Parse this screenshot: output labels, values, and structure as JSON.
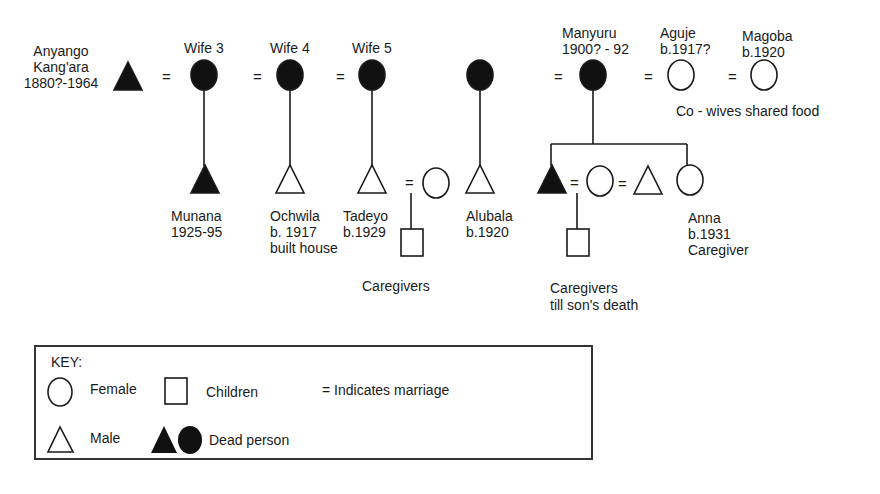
{
  "people": [
    {
      "id": "anyango",
      "shape": "triangle",
      "dead": true,
      "x": 128,
      "y": 77,
      "label": [
        "Anyango",
        "Kang'ara",
        "1880?-1964"
      ],
      "label_x": 8,
      "label_y": 43,
      "label_align": "center",
      "label_w": 106
    },
    {
      "id": "wife3",
      "shape": "circle",
      "dead": true,
      "x": 204,
      "y": 75,
      "label": [
        "Wife 3"
      ],
      "label_x": 184,
      "label_y": 40
    },
    {
      "id": "wife4",
      "shape": "circle",
      "dead": true,
      "x": 290,
      "y": 75,
      "label": [
        "Wife 4"
      ],
      "label_x": 270,
      "label_y": 40
    },
    {
      "id": "wife5",
      "shape": "circle",
      "dead": true,
      "x": 372,
      "y": 75,
      "label": [
        "Wife 5"
      ],
      "label_x": 352,
      "label_y": 40
    },
    {
      "id": "wife6",
      "shape": "circle",
      "dead": true,
      "x": 480,
      "y": 75,
      "label": []
    },
    {
      "id": "manyuru",
      "shape": "circle",
      "dead": true,
      "x": 593,
      "y": 75,
      "label": [
        "Manyuru",
        "1900? - 92"
      ],
      "label_x": 562,
      "label_y": 25
    },
    {
      "id": "aguje",
      "shape": "circle",
      "dead": false,
      "x": 681,
      "y": 75,
      "label": [
        "Aguje",
        "b.1917?"
      ],
      "label_x": 660,
      "label_y": 25
    },
    {
      "id": "magoba",
      "shape": "circle",
      "dead": false,
      "x": 764,
      "y": 75,
      "label": [
        "Magoba",
        "b.1920"
      ],
      "label_x": 742,
      "label_y": 28
    },
    {
      "id": "munana",
      "shape": "triangle",
      "dead": true,
      "x": 205,
      "y": 180,
      "label": [
        "Munana",
        "1925-95"
      ],
      "label_x": 171,
      "label_y": 208
    },
    {
      "id": "ochwila",
      "shape": "triangle",
      "dead": false,
      "x": 290,
      "y": 180,
      "label": [
        "Ochwila",
        "b. 1917",
        "built house"
      ],
      "label_x": 270,
      "label_y": 208
    },
    {
      "id": "tadeyo",
      "shape": "triangle",
      "dead": false,
      "x": 372,
      "y": 180,
      "label": [
        "Tadeyo",
        "b.1929"
      ],
      "label_x": 343,
      "label_y": 208
    },
    {
      "id": "tadeyo_wife",
      "shape": "circle",
      "dead": false,
      "x": 436,
      "y": 183,
      "label": []
    },
    {
      "id": "tadeyo_child",
      "shape": "square",
      "dead": false,
      "x": 412,
      "y": 242,
      "label": []
    },
    {
      "id": "alubala",
      "shape": "triangle",
      "dead": false,
      "x": 480,
      "y": 180,
      "label": [
        "Alubala",
        "b.1920"
      ],
      "label_x": 466,
      "label_y": 208
    },
    {
      "id": "manyuru_son",
      "shape": "triangle",
      "dead": true,
      "x": 552,
      "y": 180,
      "label": []
    },
    {
      "id": "son_wife",
      "shape": "circle",
      "dead": false,
      "x": 600,
      "y": 181,
      "label": []
    },
    {
      "id": "wife_husband",
      "shape": "triangle",
      "dead": false,
      "x": 648,
      "y": 181,
      "label": []
    },
    {
      "id": "anna",
      "shape": "circle",
      "dead": false,
      "x": 690,
      "y": 180,
      "label": [
        "Anna",
        "b.1931",
        "Caregiver"
      ],
      "label_x": 688,
      "label_y": 210
    },
    {
      "id": "son_child",
      "shape": "square",
      "dead": false,
      "x": 578,
      "y": 242,
      "label": []
    }
  ],
  "marriage_signs": [
    {
      "x": 162,
      "y": 69
    },
    {
      "x": 253,
      "y": 69
    },
    {
      "x": 336,
      "y": 69
    },
    {
      "x": 554,
      "y": 69
    },
    {
      "x": 644,
      "y": 69
    },
    {
      "x": 728,
      "y": 69
    },
    {
      "x": 405,
      "y": 175
    },
    {
      "x": 570,
      "y": 175
    },
    {
      "x": 618,
      "y": 176
    }
  ],
  "lines": [
    [
      204,
      90,
      204,
      166
    ],
    [
      290,
      90,
      290,
      166
    ],
    [
      372,
      90,
      372,
      166
    ],
    [
      480,
      90,
      480,
      166
    ],
    [
      593,
      90,
      593,
      144
    ],
    [
      551,
      144,
      687,
      144
    ],
    [
      551,
      144,
      551,
      166
    ],
    [
      687,
      144,
      687,
      166
    ],
    [
      411,
      193,
      411,
      229
    ],
    [
      577,
      193,
      577,
      229
    ]
  ],
  "annotations": [
    {
      "id": "cowives",
      "text": "Co - wives shared food",
      "x": 676,
      "y": 103
    },
    {
      "id": "caregivers1",
      "text": "Caregivers",
      "x": 362,
      "y": 278
    },
    {
      "id": "caregivers2",
      "text": "Caregivers",
      "x": 550,
      "y": 280
    },
    {
      "id": "caregivers2b",
      "text": "till son's death",
      "x": 550,
      "y": 297
    }
  ],
  "key": {
    "title": "KEY:",
    "female_label": "Female",
    "children_label": "Children",
    "marriage_label": "= Indicates marriage",
    "male_label": "Male",
    "dead_label": "Dead  person"
  },
  "colors": {
    "stroke": "#1a1a1a",
    "fill_dead": "#111111",
    "background": "#ffffff"
  }
}
